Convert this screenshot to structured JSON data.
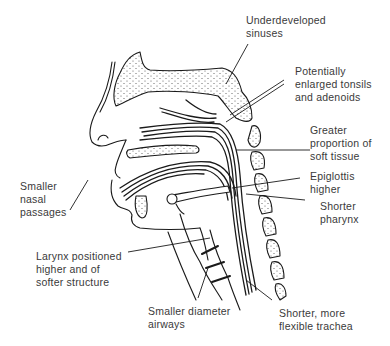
{
  "figure": {
    "labels": [
      {
        "id": "sinuses",
        "lines": [
          "Underdeveloped",
          "sinuses"
        ]
      },
      {
        "id": "tonsils",
        "lines": [
          "Potentially",
          "enlarged tonsils",
          "and adenoids"
        ]
      },
      {
        "id": "soft_tissue",
        "lines": [
          "Greater",
          "proportion of",
          "soft tissue"
        ]
      },
      {
        "id": "epiglottis",
        "lines": [
          "Epiglottis",
          "higher"
        ]
      },
      {
        "id": "pharynx",
        "lines": [
          "Shorter",
          "pharynx"
        ]
      },
      {
        "id": "nasal",
        "lines": [
          "Smaller",
          "nasal",
          "passages"
        ]
      },
      {
        "id": "larynx",
        "lines": [
          "Larynx positioned",
          "higher and of",
          "softer structure"
        ]
      },
      {
        "id": "airways",
        "lines": [
          "Smaller diameter",
          "airways"
        ]
      },
      {
        "id": "trachea",
        "lines": [
          "Shorter, more",
          "flexible trachea"
        ]
      }
    ],
    "colors": {
      "ink": "#1a1a1a",
      "text": "#3a3a3a",
      "stipple": "#555555",
      "background": "#ffffff"
    }
  }
}
